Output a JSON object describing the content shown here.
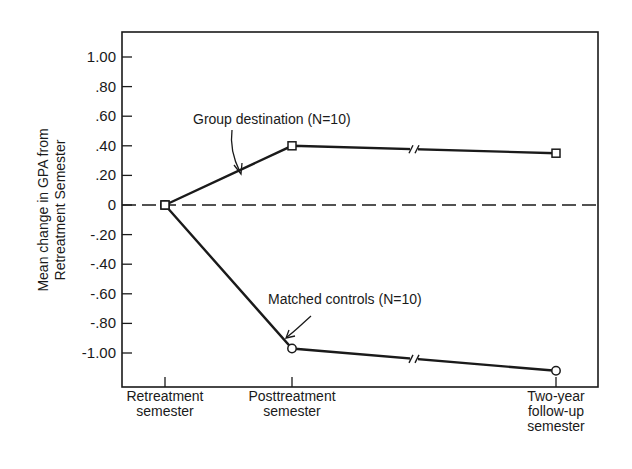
{
  "chart_data": {
    "type": "line",
    "title": "",
    "xlabel": "",
    "ylabel": "Mean change in GPA from Retreatment Semester",
    "ylabel_lines": [
      "Mean change in GPA from",
      "Retreatment Semester"
    ],
    "categories": [
      "Retreatment semester",
      "Posttreatment semester",
      "Two-year follow-up semester"
    ],
    "category_label_lines": [
      [
        "Retreatment",
        "semester"
      ],
      [
        "Posttreatment",
        "semester"
      ],
      [
        "Two-year",
        "follow-up",
        "semester"
      ]
    ],
    "series": [
      {
        "name": "Group destination (N=10)",
        "marker": "square",
        "values": [
          0,
          0.4,
          0.35
        ]
      },
      {
        "name": "Matched controls (N=10)",
        "marker": "circle",
        "values": [
          0,
          -0.97,
          -1.12
        ]
      }
    ],
    "yticks": [
      1.0,
      0.8,
      0.6,
      0.4,
      0.2,
      0,
      -0.2,
      -0.4,
      -0.6,
      -0.8,
      -1.0
    ],
    "ytick_labels": [
      "1.00",
      ".80",
      ".60",
      ".40",
      ".20",
      "0",
      "-.20",
      "-.40",
      "-.60",
      "-.80",
      "-1.00"
    ],
    "ylim": [
      -1.2,
      1.2
    ],
    "reference_line": {
      "y": 0,
      "style": "dashed"
    },
    "axis_break_between": [
      "Posttreatment semester",
      "Two-year follow-up semester"
    ],
    "annotations": [
      {
        "text": "Group destination  (N=10)",
        "points_to": "Group destination (N=10)"
      },
      {
        "text": "Matched controls  (N=10)",
        "points_to": "Matched controls (N=10)"
      }
    ],
    "grid": false,
    "legend": "inline annotations with arrows"
  }
}
